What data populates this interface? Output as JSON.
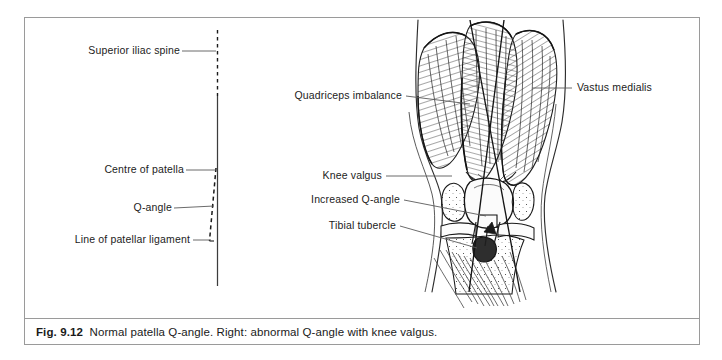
{
  "figure": {
    "number": "Fig. 9.12",
    "caption_text": "Normal patella Q-angle. Right: abnormal Q-angle with knee valgus.",
    "ink_color": "#1a1a1a",
    "frame_color": "#9a9a9a",
    "background_color": "#ffffff"
  },
  "left_diagram": {
    "title_hidden": "Normal patella Q-angle",
    "labels": [
      {
        "id": "superior-iliac-spine",
        "text": "Superior iliac spine"
      },
      {
        "id": "centre-of-patella",
        "text": "Centre of patella"
      },
      {
        "id": "q-angle",
        "text": "Q-angle"
      },
      {
        "id": "line-of-patellar-ligament",
        "text": "Line of patellar ligament"
      }
    ]
  },
  "right_diagram": {
    "title_hidden": "Abnormal Q-angle with knee valgus",
    "labels": [
      {
        "id": "quadriceps-imbalance",
        "text": "Quadriceps imbalance"
      },
      {
        "id": "vastus-medialis",
        "text": "Vastus medialis"
      },
      {
        "id": "knee-valgus",
        "text": "Knee valgus"
      },
      {
        "id": "increased-q-angle",
        "text": "Increased Q-angle"
      },
      {
        "id": "tibial-tubercle",
        "text": "Tibial tubercle"
      }
    ]
  }
}
